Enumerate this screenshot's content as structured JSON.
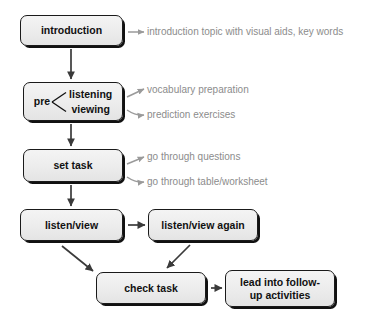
{
  "diagram": {
    "colors": {
      "node_fill": "#ececec",
      "node_border": "#1a1a1a",
      "node_shadow": "#111111",
      "node_text": "#111111",
      "annotation_text": "#8c8c8c",
      "connector": "#3a3a3a",
      "background": "#ffffff"
    },
    "nodes": [
      {
        "id": "introduction",
        "label": "introduction"
      },
      {
        "id": "pre",
        "label": "pre",
        "branches": [
          "listening",
          "viewing"
        ]
      },
      {
        "id": "set_task",
        "label": "set task"
      },
      {
        "id": "listen_view",
        "label": "listen/view"
      },
      {
        "id": "listen_again",
        "label": "listen/view again"
      },
      {
        "id": "check_task",
        "label": "check task"
      },
      {
        "id": "follow_up",
        "label": "lead into follow-up activities",
        "lines": [
          "lead into follow-",
          "up activities"
        ]
      }
    ],
    "annotations": [
      {
        "id": "intro_note",
        "text": "introduction topic with visual aids, key words",
        "source": "introduction"
      },
      {
        "id": "vocab_note",
        "text": "vocabulary preparation",
        "source": "pre"
      },
      {
        "id": "predict_note",
        "text": "prediction exercises",
        "source": "pre"
      },
      {
        "id": "question_note",
        "text": "go through questions",
        "source": "set_task"
      },
      {
        "id": "table_note",
        "text": "go through table/worksheet",
        "source": "set_task"
      }
    ],
    "edges": [
      {
        "from": "introduction",
        "to": "pre",
        "kind": "vertical"
      },
      {
        "from": "pre",
        "to": "set_task",
        "kind": "vertical"
      },
      {
        "from": "set_task",
        "to": "listen_view",
        "kind": "vertical"
      },
      {
        "from": "listen_view",
        "to": "listen_again",
        "kind": "horizontal"
      },
      {
        "from": "listen_view",
        "to": "check_task",
        "kind": "diagonal-down-right"
      },
      {
        "from": "listen_again",
        "to": "check_task",
        "kind": "diagonal-down-left"
      },
      {
        "from": "check_task",
        "to": "follow_up",
        "kind": "horizontal"
      }
    ]
  }
}
